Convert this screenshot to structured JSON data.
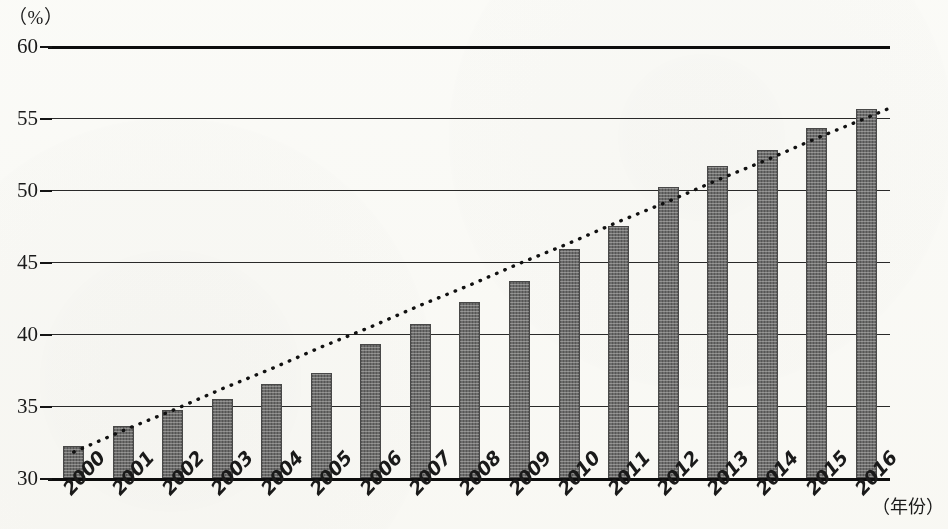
{
  "chart_data": {
    "type": "bar",
    "title": "",
    "subtitle": "",
    "unit_label": "（%）",
    "xlabel": "（年份）",
    "ylabel": "",
    "categories": [
      "2000",
      "2001",
      "2002",
      "2003",
      "2004",
      "2005",
      "2006",
      "2007",
      "2008",
      "2009",
      "2010",
      "2011",
      "2012",
      "2013",
      "2014",
      "2015",
      "2016"
    ],
    "values": [
      32.2,
      33.6,
      34.7,
      35.5,
      36.5,
      37.3,
      39.3,
      40.7,
      42.2,
      43.7,
      45.9,
      47.5,
      50.2,
      51.7,
      52.8,
      54.3,
      55.6
    ],
    "series": [
      {
        "name": "bars",
        "values": [
          32.2,
          33.6,
          34.7,
          35.5,
          36.5,
          37.3,
          39.3,
          40.7,
          42.2,
          43.7,
          45.9,
          47.5,
          50.2,
          51.7,
          52.8,
          54.3,
          55.6
        ]
      },
      {
        "name": "trend",
        "type": "dotted-line",
        "values": [
          31.8,
          33.3,
          34.7,
          36.2,
          37.6,
          39.1,
          40.5,
          42.0,
          43.4,
          44.9,
          46.3,
          47.8,
          49.2,
          50.7,
          52.1,
          53.6,
          55.0
        ]
      }
    ],
    "ylim": [
      30,
      60
    ],
    "yticks": [
      30,
      35,
      40,
      45,
      50,
      55,
      60
    ],
    "ytick_labels": [
      "30",
      "35",
      "40",
      "45",
      "50",
      "55",
      "60"
    ],
    "grid": true,
    "grid_axis": "y",
    "legend": false,
    "legend_position": "none",
    "bar_color": "#6f6f6f",
    "axis_color": "#141414",
    "trend_style": "dotted"
  }
}
